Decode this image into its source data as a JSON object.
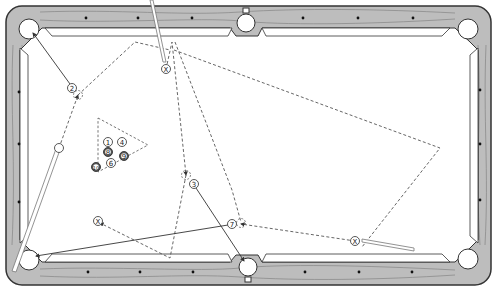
{
  "diagram": {
    "type": "pool-table-shot-diagram",
    "colors": {
      "rail": "#b9b9b9",
      "rail_grain": "#7a7a7a",
      "rail_border": "#333333",
      "felt": "#ffffff",
      "path_line": "#555555",
      "cue": "#888888",
      "ball_outline": "#444444",
      "dark_ball": "#555555"
    },
    "balls": [
      {
        "label": "1",
        "x": 108,
        "y": 142,
        "dark": false
      },
      {
        "label": "4",
        "x": 122,
        "y": 142,
        "dark": false
      },
      {
        "label": "8",
        "x": 108,
        "y": 152,
        "dark": true
      },
      {
        "label": "9",
        "x": 124,
        "y": 156,
        "dark": true
      },
      {
        "label": "6",
        "x": 111,
        "y": 163,
        "dark": false
      },
      {
        "label": "10",
        "x": 96,
        "y": 167,
        "dark": true
      },
      {
        "label": "2",
        "x": 72,
        "y": 88,
        "dark": false
      },
      {
        "label": "3",
        "x": 194,
        "y": 184,
        "dark": false
      },
      {
        "label": "7",
        "x": 232,
        "y": 224,
        "dark": false
      }
    ],
    "cue_ball_positions": [
      {
        "label": "X",
        "x": 166,
        "y": 69
      },
      {
        "label": "X",
        "x": 98,
        "y": 221
      },
      {
        "label": "X",
        "x": 355,
        "y": 241
      }
    ],
    "ghost_balls": [
      {
        "x": 78,
        "y": 95
      },
      {
        "x": 59,
        "y": 148
      },
      {
        "x": 186,
        "y": 175
      },
      {
        "x": 241,
        "y": 224
      }
    ],
    "pockets": [
      {
        "name": "top-left",
        "x": 29,
        "y": 29
      },
      {
        "name": "top-middle",
        "x": 246,
        "y": 23
      },
      {
        "name": "top-right",
        "x": 468,
        "y": 29
      },
      {
        "name": "bottom-left",
        "x": 29,
        "y": 260
      },
      {
        "name": "bottom-middle",
        "x": 248,
        "y": 267
      },
      {
        "name": "bottom-right",
        "x": 468,
        "y": 259
      }
    ],
    "diamonds": {
      "top": [
        [
          86,
          18
        ],
        [
          138,
          18
        ],
        [
          192,
          18
        ],
        [
          303,
          18
        ],
        [
          358,
          18
        ],
        [
          413,
          18
        ]
      ],
      "bottom": [
        [
          88,
          272
        ],
        [
          140,
          272
        ],
        [
          193,
          272
        ],
        [
          305,
          272
        ],
        [
          359,
          272
        ],
        [
          412,
          272
        ]
      ],
      "left": [
        [
          19,
          92
        ],
        [
          19,
          144
        ],
        [
          19,
          202
        ]
      ],
      "right": [
        [
          480,
          90
        ],
        [
          480,
          144
        ],
        [
          480,
          200
        ]
      ]
    },
    "rack_outline": [
      [
        98,
        118
      ],
      [
        148,
        145
      ],
      [
        98,
        172
      ]
    ],
    "object_ball_paths": [
      {
        "from": [
          72,
          88
        ],
        "to": [
          33,
          33
        ],
        "label": "2 to top-left pocket"
      },
      {
        "from": [
          194,
          184
        ],
        "to": [
          244,
          262
        ],
        "label": "3 to bottom-middle pocket"
      },
      {
        "from": [
          232,
          224
        ],
        "to": [
          36,
          256
        ],
        "label": "7 to bottom-left pocket"
      }
    ],
    "cue_ball_paths": [
      {
        "points": [
          [
            59,
            148
          ],
          [
            78,
            95
          ],
          [
            135,
            42
          ],
          [
            168,
            52
          ]
        ]
      },
      {
        "points": [
          [
            166,
            69
          ],
          [
            172,
            42
          ],
          [
            186,
            175
          ]
        ]
      },
      {
        "points": [
          [
            174,
            50
          ],
          [
            440,
            148
          ],
          [
            362,
            247
          ]
        ]
      },
      {
        "points": [
          [
            186,
            175
          ],
          [
            170,
            258
          ],
          [
            98,
            221
          ]
        ]
      },
      {
        "points": [
          [
            175,
            42
          ],
          [
            232,
            190
          ],
          [
            241,
            224
          ]
        ]
      },
      {
        "points": [
          [
            355,
            241
          ],
          [
            241,
            224
          ]
        ]
      }
    ],
    "cue_sticks": [
      {
        "from": [
          151,
          0
        ],
        "to": [
          164,
          62
        ]
      },
      {
        "from": [
          414,
          250
        ],
        "to": [
          362,
          240
        ]
      },
      {
        "from": [
          60,
          146
        ],
        "to": [
          14,
          272
        ]
      }
    ]
  }
}
